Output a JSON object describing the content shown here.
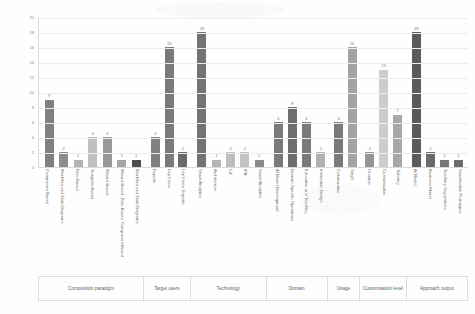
{
  "chart_data": {
    "type": "bar",
    "title": "",
    "xlabel": "",
    "ylabel": "",
    "ylim": [
      0,
      20
    ],
    "ytick_step": 2,
    "grid": true,
    "legend": "none",
    "yticks": [
      "0",
      "2",
      "4",
      "6",
      "8",
      "10",
      "12",
      "14",
      "16",
      "18",
      "20"
    ],
    "groups": [
      {
        "name": "Composition paradigm",
        "categories": [
          "Component-Based",
          "Workflow and Data Diagrams",
          "Rule-Based",
          "Template-Based",
          "Wizard-Based",
          "Wizard-Based, Rule-Based, Component-Based",
          "Workflow and Data Diagrams"
        ],
        "values": [
          9,
          2,
          1,
          4,
          4,
          1,
          1
        ],
        "colors": [
          "#808080",
          "#8c8c8c",
          "#b3b3b3",
          "#bfbfbf",
          "#999999",
          "#a6a6a6",
          "#4d4d4d"
        ]
      },
      {
        "name": "Target users",
        "categories": [
          "Experts",
          "Lay Users",
          "Lay Users, Experts"
        ],
        "values": [
          4,
          16,
          2
        ],
        "colors": [
          "#808080",
          "#7a7a7a",
          "#6b6b6b"
        ]
      },
      {
        "name": "Technology",
        "categories": [
          "Visual Analytics",
          "Architecture",
          "IoT",
          "IPA",
          "Visual Analytics"
        ],
        "values": [
          18,
          1,
          2,
          2,
          1
        ],
        "colors": [
          "#737373",
          "#b5b5b5",
          "#bdbdbd",
          "#c2c2c2",
          "#8a8a8a"
        ]
      },
      {
        "name": "Domain",
        "categories": [
          "AI Model Development",
          "Domain-Specific Operations",
          "Education and Teaching",
          "Interaction Design"
        ],
        "values": [
          6,
          8,
          6,
          2
        ],
        "colors": [
          "#7a7a7a",
          "#6e6e6e",
          "#7a7a7a",
          "#b0b0b0"
        ]
      },
      {
        "name": "Usage",
        "categories": [
          "Collaborative",
          "Single"
        ],
        "values": [
          6,
          16
        ],
        "colors": [
          "#7a7a7a",
          "#a3a3a3"
        ]
      },
      {
        "name": "Customisation level",
        "categories": [
          "Creation",
          "Customisation",
          "Tailoring"
        ],
        "values": [
          2,
          13,
          7
        ],
        "colors": [
          "#969696",
          "#cccccc",
          "#a8a8a8"
        ]
      },
      {
        "name": "Approach output",
        "categories": [
          "AI Model",
          "Business Model",
          "Teaching Suggestions",
          "Visualisation Prototypes"
        ],
        "values": [
          18,
          2,
          1,
          1
        ],
        "colors": [
          "#5a5a5a",
          "#6b6b6b",
          "#757575",
          "#6b6b6b"
        ]
      }
    ]
  },
  "style": {
    "axis_color": "#d9d9d9",
    "grid_color": "#ededed",
    "label_color": "#6e6e6e",
    "value_color": "#7d7d7d",
    "background": "#fefefe"
  }
}
